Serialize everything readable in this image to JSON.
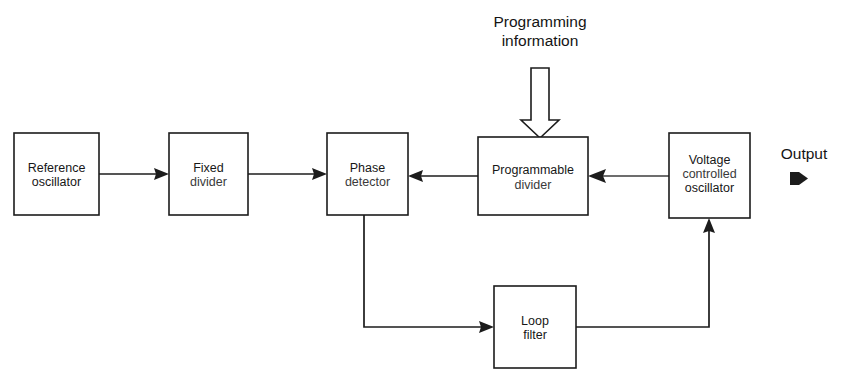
{
  "diagram": {
    "type": "block-diagram",
    "background_color": "#ffffff",
    "line_color": "#1c1c1c",
    "text_color": "#141414",
    "blocks": [
      {
        "id": "reference-oscillator",
        "label_line1": "Reference",
        "label_line2": "oscillator",
        "x": 14,
        "y": 133,
        "w": 85,
        "h": 82
      },
      {
        "id": "fixed-divider",
        "label_line1": "Fixed",
        "label_line2": "divider",
        "x": 169,
        "y": 133,
        "w": 79,
        "h": 82
      },
      {
        "id": "phase-detector",
        "label_line1": "Phase",
        "label_line2": "detector",
        "x": 327,
        "y": 133,
        "w": 81,
        "h": 82
      },
      {
        "id": "programmable-divider",
        "label_line1": "Programmable",
        "label_line2": "divider",
        "x": 478,
        "y": 137,
        "w": 110,
        "h": 78
      },
      {
        "id": "voltage-controlled-oscillator",
        "label_line1": "Voltage",
        "label_line2": "controlled",
        "label_line3": "oscillator",
        "x": 669,
        "y": 133,
        "w": 81,
        "h": 85
      },
      {
        "id": "loop-filter",
        "label_line1": "Loop",
        "label_line2": "filter",
        "x": 494,
        "y": 286,
        "w": 82,
        "h": 82
      }
    ],
    "annotations": {
      "programming_line1": "Programming",
      "programming_line2": "information",
      "output_label": "Output"
    },
    "connections": [
      {
        "id": "ref-to-fixed",
        "from": "reference-oscillator",
        "to": "fixed-divider",
        "direction": "right"
      },
      {
        "id": "fixed-to-phase",
        "from": "fixed-divider",
        "to": "phase-detector",
        "direction": "right"
      },
      {
        "id": "progdiv-to-phase",
        "from": "programmable-divider",
        "to": "phase-detector",
        "direction": "left"
      },
      {
        "id": "vco-to-progdiv",
        "from": "voltage-controlled-oscillator",
        "to": "programmable-divider",
        "direction": "left"
      },
      {
        "id": "programming-to-progdiv",
        "from": "programming-information",
        "to": "programmable-divider",
        "direction": "down"
      },
      {
        "id": "phase-to-loopfilter",
        "from": "phase-detector",
        "to": "loop-filter",
        "direction": "down-right"
      },
      {
        "id": "loopfilter-to-vco",
        "from": "loop-filter",
        "to": "voltage-controlled-oscillator",
        "direction": "right-up"
      }
    ]
  }
}
